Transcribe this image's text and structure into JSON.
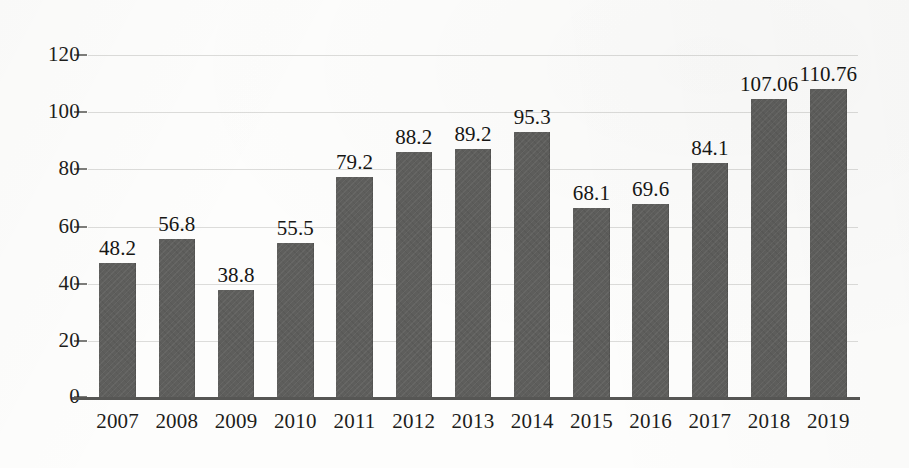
{
  "chart_data": {
    "type": "bar",
    "title": "",
    "subtitle": "",
    "xlabel": "",
    "ylabel": "",
    "categories": [
      "2007",
      "2008",
      "2009",
      "2010",
      "2011",
      "2012",
      "2013",
      "2014",
      "2015",
      "2016",
      "2017",
      "2018",
      "2019"
    ],
    "values": [
      48.2,
      56.8,
      38.8,
      55.5,
      79.2,
      88.2,
      89.2,
      95.3,
      68.1,
      69.6,
      84.1,
      107.06,
      110.76
    ],
    "value_labels": [
      "48.2",
      "56.8",
      "38.8",
      "55.5",
      "79.2",
      "88.2",
      "89.2",
      "95.3",
      "68.1",
      "69.6",
      "84.1",
      "107.06",
      "110.76"
    ],
    "ylim": [
      0,
      120
    ],
    "ytick_values": [
      0,
      20,
      40,
      60,
      80,
      100,
      120
    ],
    "ytick_labels": [
      "0",
      "20",
      "40",
      "60",
      "80",
      "100",
      "120"
    ],
    "grid": true,
    "grid_axis": "y",
    "legend": false,
    "legend_position": "none",
    "series": [
      {
        "name": "",
        "values": [
          48.2,
          56.8,
          38.8,
          55.5,
          79.2,
          88.2,
          89.2,
          95.3,
          68.1,
          69.6,
          84.1,
          107.06,
          110.76
        ]
      }
    ]
  },
  "style": {
    "bar_color": "#5e5e5c",
    "gridline_color": "#d9d9d7",
    "axis_color": "#565654",
    "text_color": "#1d1d1b",
    "background_color": "#fdfdfc"
  }
}
